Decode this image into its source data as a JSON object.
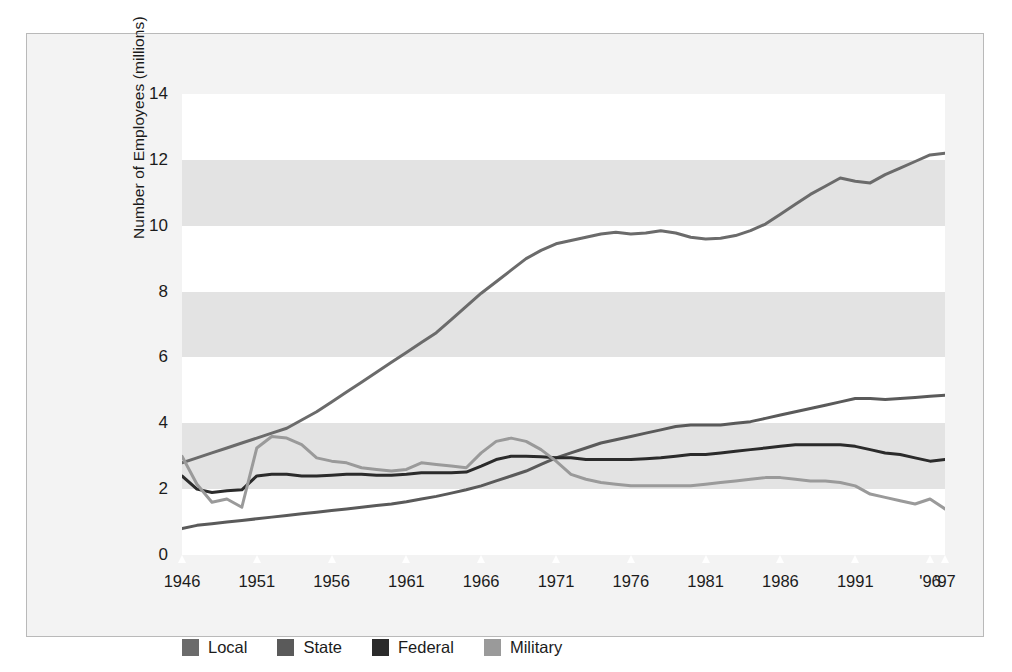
{
  "chart_data": {
    "type": "line",
    "title": "",
    "xlabel": "",
    "ylabel": "Number of Employees (millions)",
    "ylim": [
      0,
      14
    ],
    "xlim": [
      1946,
      1997
    ],
    "grid": "horizontal-bands",
    "legend_position": "bottom-left",
    "yticks": [
      "14",
      "12",
      "10",
      "8",
      "6",
      "4",
      "2",
      "0"
    ],
    "ytick_values": [
      14,
      12,
      10,
      8,
      6,
      4,
      2,
      0
    ],
    "xticks": [
      "1946",
      "1951",
      "1956",
      "1961",
      "1966",
      "1971",
      "1976",
      "1981",
      "1986",
      "1991",
      "'96",
      "'97"
    ],
    "xtick_values": [
      1946,
      1951,
      1956,
      1961,
      1966,
      1971,
      1976,
      1981,
      1986,
      1991,
      1996,
      1997
    ],
    "x": [
      1946,
      1947,
      1948,
      1949,
      1950,
      1951,
      1952,
      1953,
      1954,
      1955,
      1956,
      1957,
      1958,
      1959,
      1960,
      1961,
      1962,
      1963,
      1964,
      1965,
      1966,
      1967,
      1968,
      1969,
      1970,
      1971,
      1972,
      1973,
      1974,
      1975,
      1976,
      1977,
      1978,
      1979,
      1980,
      1981,
      1982,
      1983,
      1984,
      1985,
      1986,
      1987,
      1988,
      1989,
      1990,
      1991,
      1992,
      1993,
      1994,
      1995,
      1996,
      1997
    ],
    "series": [
      {
        "name": "Local",
        "color": "#6b6b6b",
        "values": [
          2.8,
          2.95,
          3.1,
          3.25,
          3.4,
          3.55,
          3.7,
          3.85,
          4.1,
          4.35,
          4.65,
          4.95,
          5.25,
          5.55,
          5.85,
          6.15,
          6.45,
          6.75,
          7.15,
          7.55,
          7.95,
          8.3,
          8.65,
          9.0,
          9.25,
          9.45,
          9.55,
          9.65,
          9.75,
          9.8,
          9.75,
          9.78,
          9.85,
          9.78,
          9.65,
          9.6,
          9.62,
          9.7,
          9.85,
          10.05,
          10.35,
          10.65,
          10.95,
          11.2,
          11.45,
          11.35,
          11.3,
          11.55,
          11.75,
          11.95,
          12.15,
          12.2
        ]
      },
      {
        "name": "State",
        "color": "#5a5a5a",
        "values": [
          0.8,
          0.9,
          0.95,
          1.0,
          1.05,
          1.1,
          1.15,
          1.2,
          1.25,
          1.3,
          1.35,
          1.4,
          1.45,
          1.5,
          1.55,
          1.62,
          1.7,
          1.78,
          1.88,
          1.98,
          2.1,
          2.25,
          2.4,
          2.55,
          2.75,
          2.95,
          3.1,
          3.25,
          3.4,
          3.5,
          3.6,
          3.7,
          3.8,
          3.9,
          3.95,
          3.95,
          3.95,
          4.0,
          4.05,
          4.15,
          4.25,
          4.35,
          4.45,
          4.55,
          4.65,
          4.75,
          4.75,
          4.72,
          4.75,
          4.78,
          4.82,
          4.85
        ]
      },
      {
        "name": "Federal",
        "color": "#2b2b2b",
        "values": [
          2.4,
          2.0,
          1.9,
          1.95,
          1.98,
          2.4,
          2.45,
          2.45,
          2.4,
          2.4,
          2.42,
          2.45,
          2.45,
          2.42,
          2.42,
          2.45,
          2.5,
          2.5,
          2.5,
          2.52,
          2.7,
          2.9,
          3.0,
          3.0,
          2.98,
          2.95,
          2.95,
          2.9,
          2.9,
          2.9,
          2.9,
          2.92,
          2.95,
          3.0,
          3.05,
          3.05,
          3.1,
          3.15,
          3.2,
          3.25,
          3.3,
          3.35,
          3.35,
          3.35,
          3.35,
          3.3,
          3.2,
          3.1,
          3.05,
          2.95,
          2.85,
          2.9
        ]
      },
      {
        "name": "Military",
        "color": "#9a9a9a",
        "values": [
          3.0,
          2.15,
          1.6,
          1.7,
          1.45,
          3.25,
          3.6,
          3.55,
          3.35,
          2.95,
          2.85,
          2.8,
          2.65,
          2.6,
          2.55,
          2.6,
          2.8,
          2.75,
          2.7,
          2.65,
          3.1,
          3.45,
          3.55,
          3.45,
          3.2,
          2.85,
          2.45,
          2.3,
          2.2,
          2.15,
          2.1,
          2.1,
          2.1,
          2.1,
          2.1,
          2.15,
          2.2,
          2.25,
          2.3,
          2.35,
          2.35,
          2.3,
          2.25,
          2.25,
          2.2,
          2.1,
          1.85,
          1.75,
          1.65,
          1.55,
          1.7,
          1.4
        ]
      }
    ]
  },
  "axis": {
    "ylabel": "Number of Employees (millions)"
  },
  "legend": {
    "items": [
      {
        "label": "Local",
        "color": "#6b6b6b"
      },
      {
        "label": "State",
        "color": "#5a5a5a"
      },
      {
        "label": "Federal",
        "color": "#2b2b2b"
      },
      {
        "label": "Military",
        "color": "#9a9a9a"
      }
    ]
  }
}
